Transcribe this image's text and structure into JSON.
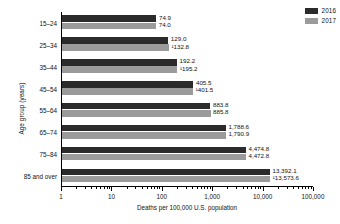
{
  "chart_data": {
    "type": "bar",
    "orientation": "horizontal",
    "title": "",
    "xlabel": "Deaths per 100,000 U.S. population",
    "ylabel": "Age group (years)",
    "xscale": "log",
    "xlim": [
      1,
      100000
    ],
    "grid": false,
    "legend_position": "top-right",
    "categories": [
      "15–24",
      "25–34",
      "35–44",
      "45–54",
      "55–64",
      "65–74",
      "75–84",
      "85 and over"
    ],
    "xticks": [
      1,
      10,
      100,
      1000,
      10000,
      100000
    ],
    "xtick_labels": [
      "1",
      "10",
      "100",
      "1,000",
      "10,000",
      "100,000"
    ],
    "series": [
      {
        "name": "2016",
        "color": "#2b2b2b",
        "values": [
          74.9,
          129.0,
          192.2,
          405.5,
          883.8,
          1788.6,
          4474.8,
          13392.1
        ],
        "labels": [
          "74.9",
          "129.0",
          "192.2",
          "405.5",
          "883.8",
          "1,788.6",
          "4,474.8",
          "13,392.1"
        ]
      },
      {
        "name": "2017",
        "color": "#9b9b9b",
        "values": [
          74.0,
          132.8,
          195.2,
          401.5,
          885.8,
          1790.9,
          4472.8,
          13573.6
        ],
        "labels": [
          "74.0",
          "¹132.8",
          "¹195.2",
          "¹401.5",
          "885.8",
          "1,790.9",
          "4,472.8",
          "¹13,573.6"
        ]
      }
    ]
  },
  "legend": {
    "items": [
      {
        "label": "2016",
        "color": "#2b2b2b"
      },
      {
        "label": "2017",
        "color": "#9b9b9b"
      }
    ]
  }
}
